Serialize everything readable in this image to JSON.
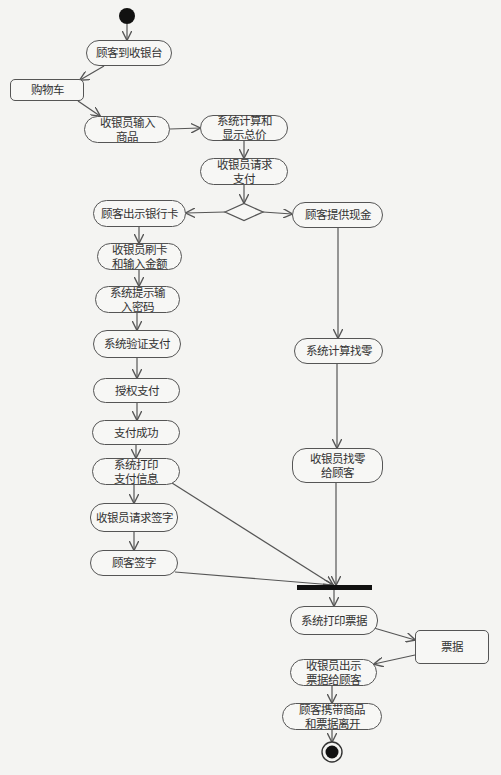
{
  "diagram": {
    "type": "UML activity diagram",
    "start": {
      "x": 127,
      "y": 16,
      "r": 8
    },
    "end": {
      "x": 332,
      "y": 752,
      "r": 10
    },
    "decision": {
      "x": 244,
      "y": 212,
      "w": 38,
      "h": 17
    },
    "join_bar": {
      "x": 297,
      "y": 585,
      "w": 75,
      "h": 5
    },
    "nodes": [
      {
        "id": "arrive",
        "label": "顾客到收银台",
        "kind": "action",
        "x": 86,
        "y": 40,
        "w": 86,
        "h": 26
      },
      {
        "id": "cart",
        "label": "购物车",
        "kind": "object",
        "x": 10,
        "y": 79,
        "w": 74,
        "h": 22
      },
      {
        "id": "enter_items",
        "label": "收银员输入\n商品",
        "kind": "action",
        "x": 84,
        "y": 116,
        "w": 86,
        "h": 27
      },
      {
        "id": "calc_total",
        "label": "系统计算和\n显示总价",
        "kind": "action",
        "x": 200,
        "y": 115,
        "w": 88,
        "h": 26
      },
      {
        "id": "request_pay",
        "label": "收银员请求\n支付",
        "kind": "action",
        "x": 200,
        "y": 158,
        "w": 88,
        "h": 27
      },
      {
        "id": "show_card",
        "label": "顾客出示银行卡",
        "kind": "action",
        "x": 93,
        "y": 200,
        "w": 93,
        "h": 27
      },
      {
        "id": "give_cash",
        "label": "顾客提供现金",
        "kind": "action",
        "x": 292,
        "y": 202,
        "w": 91,
        "h": 26
      },
      {
        "id": "swipe_card",
        "label": "收银员刷卡\n和输入金额",
        "kind": "action",
        "x": 97,
        "y": 243,
        "w": 85,
        "h": 27
      },
      {
        "id": "prompt_pin",
        "label": "系统提示输\n入密码",
        "kind": "action",
        "x": 95,
        "y": 286,
        "w": 85,
        "h": 27
      },
      {
        "id": "verify_pay",
        "label": "系统验证支付",
        "kind": "action",
        "x": 93,
        "y": 330,
        "w": 88,
        "h": 28
      },
      {
        "id": "authorize",
        "label": "授权支付",
        "kind": "action",
        "x": 93,
        "y": 378,
        "w": 87,
        "h": 25
      },
      {
        "id": "pay_success",
        "label": "支付成功",
        "kind": "action",
        "x": 92,
        "y": 420,
        "w": 88,
        "h": 25
      },
      {
        "id": "print_pay_info",
        "label": "系统打印\n支付信息",
        "kind": "action",
        "x": 92,
        "y": 458,
        "w": 88,
        "h": 27
      },
      {
        "id": "request_sign",
        "label": "收银员请求签字",
        "kind": "action",
        "x": 90,
        "y": 503,
        "w": 88,
        "h": 29
      },
      {
        "id": "customer_sign",
        "label": "顾客签字",
        "kind": "action",
        "x": 90,
        "y": 550,
        "w": 88,
        "h": 26
      },
      {
        "id": "calc_change",
        "label": "系统计算找零",
        "kind": "action",
        "x": 294,
        "y": 338,
        "w": 89,
        "h": 26
      },
      {
        "id": "give_change",
        "label": "收银员找零\n给顾客",
        "kind": "action",
        "x": 292,
        "y": 448,
        "w": 91,
        "h": 35
      },
      {
        "id": "print_receipt",
        "label": "系统打印票据",
        "kind": "action",
        "x": 290,
        "y": 606,
        "w": 88,
        "h": 29
      },
      {
        "id": "receipt",
        "label": "票据",
        "kind": "object",
        "x": 415,
        "y": 630,
        "w": 74,
        "h": 34
      },
      {
        "id": "show_receipt",
        "label": "收银员出示\n票据给顾客",
        "kind": "action",
        "x": 290,
        "y": 659,
        "w": 87,
        "h": 27
      },
      {
        "id": "leave",
        "label": "顾客携带商品\n和票据离开",
        "kind": "action",
        "x": 282,
        "y": 703,
        "w": 100,
        "h": 27
      }
    ],
    "edges": [
      {
        "from": "start",
        "pts": [
          [
            127,
            24
          ],
          [
            127,
            40
          ]
        ]
      },
      {
        "from": "arrive",
        "to": "cart",
        "pts": [
          [
            104,
            66
          ],
          [
            80,
            80
          ]
        ]
      },
      {
        "from": "cart",
        "to": "enter_items",
        "pts": [
          [
            78,
            101
          ],
          [
            100,
            116
          ]
        ]
      },
      {
        "from": "enter_items",
        "to": "calc_total",
        "pts": [
          [
            170,
            129
          ],
          [
            200,
            128
          ]
        ]
      },
      {
        "from": "calc_total",
        "to": "request_pay",
        "pts": [
          [
            244,
            141
          ],
          [
            244,
            158
          ]
        ]
      },
      {
        "from": "request_pay",
        "to": "decision",
        "pts": [
          [
            244,
            185
          ],
          [
            244,
            203
          ]
        ]
      },
      {
        "from": "decision",
        "to": "show_card",
        "pts": [
          [
            225,
            212
          ],
          [
            186,
            213
          ]
        ]
      },
      {
        "from": "decision",
        "to": "give_cash",
        "pts": [
          [
            263,
            212
          ],
          [
            292,
            214
          ]
        ]
      },
      {
        "from": "show_card",
        "to": "swipe_card",
        "pts": [
          [
            139,
            227
          ],
          [
            139,
            243
          ]
        ]
      },
      {
        "from": "swipe_card",
        "to": "prompt_pin",
        "pts": [
          [
            139,
            270
          ],
          [
            139,
            286
          ]
        ]
      },
      {
        "from": "prompt_pin",
        "to": "verify_pay",
        "pts": [
          [
            137,
            313
          ],
          [
            137,
            330
          ]
        ]
      },
      {
        "from": "verify_pay",
        "to": "authorize",
        "pts": [
          [
            137,
            358
          ],
          [
            137,
            378
          ]
        ]
      },
      {
        "from": "authorize",
        "to": "pay_success",
        "pts": [
          [
            137,
            403
          ],
          [
            137,
            420
          ]
        ]
      },
      {
        "from": "pay_success",
        "to": "print_pay_info",
        "pts": [
          [
            136,
            445
          ],
          [
            136,
            458
          ]
        ]
      },
      {
        "from": "print_pay_info",
        "to": "request_sign",
        "pts": [
          [
            134,
            485
          ],
          [
            134,
            503
          ]
        ]
      },
      {
        "from": "request_sign",
        "to": "customer_sign",
        "pts": [
          [
            134,
            532
          ],
          [
            134,
            550
          ]
        ]
      },
      {
        "from": "print_pay_info",
        "to": "join",
        "pts": [
          [
            172,
            483
          ],
          [
            333,
            585
          ]
        ]
      },
      {
        "from": "customer_sign",
        "to": "join",
        "pts": [
          [
            175,
            572
          ],
          [
            333,
            585
          ]
        ]
      },
      {
        "from": "give_cash",
        "to": "calc_change",
        "pts": [
          [
            338,
            228
          ],
          [
            338,
            338
          ]
        ]
      },
      {
        "from": "calc_change",
        "to": "give_change",
        "pts": [
          [
            337,
            364
          ],
          [
            337,
            448
          ]
        ]
      },
      {
        "from": "give_change",
        "to": "join",
        "pts": [
          [
            336,
            483
          ],
          [
            336,
            585
          ]
        ]
      },
      {
        "from": "join",
        "to": "print_receipt",
        "pts": [
          [
            334,
            590
          ],
          [
            334,
            606
          ]
        ]
      },
      {
        "from": "print_receipt",
        "to": "receipt",
        "pts": [
          [
            374,
            628
          ],
          [
            415,
            640
          ]
        ]
      },
      {
        "from": "receipt",
        "to": "show_receipt",
        "pts": [
          [
            415,
            655
          ],
          [
            374,
            664
          ]
        ]
      },
      {
        "from": "show_receipt",
        "to": "leave",
        "pts": [
          [
            332,
            686
          ],
          [
            332,
            703
          ]
        ]
      },
      {
        "from": "leave",
        "to": "end",
        "pts": [
          [
            332,
            730
          ],
          [
            332,
            742
          ]
        ]
      }
    ]
  },
  "colors": {
    "background": "#f4f4f2",
    "stroke": "#555555",
    "fill": "#f7f7f5",
    "text": "#333333",
    "bar": "#111111"
  }
}
